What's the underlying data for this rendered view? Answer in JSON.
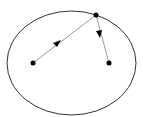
{
  "diagram": {
    "type": "ellipse-reflection",
    "ellipse": {
      "cx": 71.5,
      "cy": 63,
      "rx": 64.5,
      "ry": 52,
      "stroke": "#333333"
    },
    "foci": [
      {
        "name": "left-focus",
        "x": 33,
        "y": 63
      },
      {
        "name": "right-focus",
        "x": 109,
        "y": 63
      }
    ],
    "point_on_ellipse": {
      "x": 96,
      "y": 15
    },
    "rays": [
      {
        "from": "left-focus",
        "to": "point_on_ellipse",
        "arrow_at": [
          57,
          43
        ]
      },
      {
        "from": "point_on_ellipse",
        "to": "right-focus",
        "arrow_at": [
          100,
          35
        ]
      }
    ],
    "colors": {
      "ray": "#888888",
      "dot": "#000000",
      "arrow": "#000000"
    }
  }
}
